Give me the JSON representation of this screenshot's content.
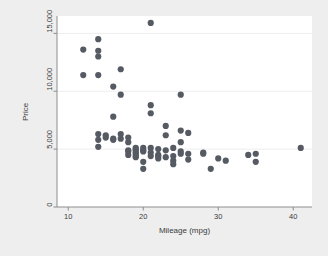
{
  "chart_data": {
    "type": "scatter",
    "title": "",
    "xlabel": "Mileage (mpg)",
    "ylabel": "Price",
    "xlim": [
      8.5,
      42.5
    ],
    "ylim": [
      0,
      16500
    ],
    "xticks": [
      10,
      20,
      30,
      40
    ],
    "xtick_labels": [
      "10",
      "20",
      "30",
      "40"
    ],
    "yticks": [
      0,
      5000,
      10000,
      15000
    ],
    "ytick_labels": [
      "0",
      "5,000",
      "10,000",
      "15,000"
    ],
    "grid": "horizontal",
    "legend": "none",
    "marker_color": "#555a63",
    "marker_size": 3.1,
    "background_color": "#eeeeee",
    "plot_background_color": "#ffffff",
    "axis_color": "#8d8d8d",
    "gridline_color": "#e8e8e8",
    "n_points": 74,
    "points": [
      [
        12,
        13600
      ],
      [
        12,
        11400
      ],
      [
        14,
        14500
      ],
      [
        14,
        13500
      ],
      [
        14,
        13000
      ],
      [
        14,
        11400
      ],
      [
        14,
        6300
      ],
      [
        14,
        5800
      ],
      [
        14,
        5200
      ],
      [
        15,
        6200
      ],
      [
        15,
        6000
      ],
      [
        16,
        10400
      ],
      [
        16,
        7800
      ],
      [
        16,
        5900
      ],
      [
        16,
        5800
      ],
      [
        17,
        11900
      ],
      [
        17,
        9700
      ],
      [
        17,
        6300
      ],
      [
        17,
        5900
      ],
      [
        18,
        5600
      ],
      [
        18,
        4900
      ],
      [
        18,
        4800
      ],
      [
        18,
        4500
      ],
      [
        18,
        6000
      ],
      [
        19,
        5100
      ],
      [
        19,
        5000
      ],
      [
        19,
        4900
      ],
      [
        19,
        4700
      ],
      [
        19,
        4600
      ],
      [
        19,
        4400
      ],
      [
        19,
        4300
      ],
      [
        20,
        5100
      ],
      [
        20,
        4900
      ],
      [
        20,
        4800
      ],
      [
        20,
        3900
      ],
      [
        20,
        3300
      ],
      [
        21,
        15900
      ],
      [
        21,
        8800
      ],
      [
        21,
        8100
      ],
      [
        21,
        5100
      ],
      [
        21,
        4700
      ],
      [
        21,
        4400
      ],
      [
        22,
        5000
      ],
      [
        22,
        4500
      ],
      [
        22,
        4400
      ],
      [
        22,
        4200
      ],
      [
        23,
        7000
      ],
      [
        23,
        6200
      ],
      [
        23,
        4900
      ],
      [
        23,
        4300
      ],
      [
        24,
        5100
      ],
      [
        24,
        4400
      ],
      [
        24,
        4000
      ],
      [
        24,
        3700
      ],
      [
        25,
        9700
      ],
      [
        25,
        6600
      ],
      [
        25,
        5600
      ],
      [
        25,
        4800
      ],
      [
        25,
        4600
      ],
      [
        26,
        6400
      ],
      [
        26,
        4600
      ],
      [
        26,
        4100
      ],
      [
        28,
        4700
      ],
      [
        28,
        4600
      ],
      [
        29,
        3300
      ],
      [
        30,
        4200
      ],
      [
        31,
        4000
      ],
      [
        34,
        4500
      ],
      [
        35,
        4600
      ],
      [
        35,
        3900
      ],
      [
        41,
        5100
      ]
    ]
  },
  "axis": {
    "x_title": "Mileage (mpg)",
    "y_title": "Price"
  }
}
